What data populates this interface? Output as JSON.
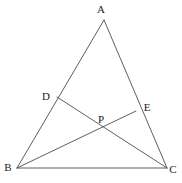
{
  "figure": {
    "background_color": "#ffffff",
    "line_color": "#4d4d4d",
    "label_color": "#1a1a1a",
    "canvas": {
      "width": 182,
      "height": 183
    }
  },
  "labels": {
    "a": "A",
    "b": "B",
    "c": "C",
    "d": "D",
    "e": "E",
    "p": "P"
  },
  "chart_data": {
    "type": "diagram",
    "points": [
      {
        "name": "A",
        "x": 104,
        "y": 20,
        "label_x": 101,
        "label_y": 9,
        "on": "apex"
      },
      {
        "name": "B",
        "x": 17,
        "y": 168,
        "label_x": 8,
        "label_y": 167,
        "on": "bottom-left vertex"
      },
      {
        "name": "C",
        "x": 167,
        "y": 168,
        "label_x": 173,
        "label_y": 169,
        "on": "bottom-right vertex"
      },
      {
        "name": "D",
        "x": 57,
        "y": 97,
        "label_x": 46,
        "label_y": 96,
        "on": "segment AB"
      },
      {
        "name": "E",
        "x": 136,
        "y": 111,
        "label_x": 147,
        "label_y": 107,
        "on": "segment AC"
      },
      {
        "name": "P",
        "x": 101,
        "y": 130,
        "label_x": 101,
        "label_y": 119,
        "on": "intersection of DC and BE"
      }
    ],
    "segments": [
      {
        "name": "AB",
        "from": "A",
        "to": "B",
        "kind": "triangle-side"
      },
      {
        "name": "AC",
        "from": "A",
        "to": "C",
        "kind": "triangle-side"
      },
      {
        "name": "BC",
        "from": "B",
        "to": "C",
        "kind": "triangle-side"
      },
      {
        "name": "DC",
        "from": "D",
        "to": "C",
        "kind": "cevian"
      },
      {
        "name": "BE",
        "from": "B",
        "to": "E",
        "kind": "cevian"
      }
    ]
  }
}
